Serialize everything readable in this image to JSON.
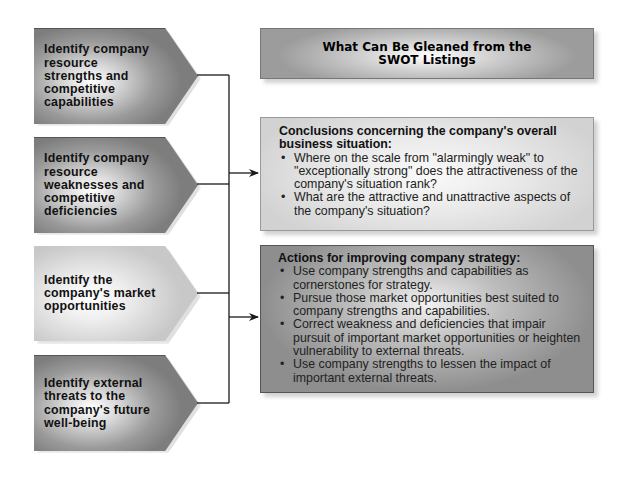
{
  "left_boxes": [
    {
      "id": "strengths",
      "text": "Identify company resource strengths and competitive capabilities",
      "shade": "dark"
    },
    {
      "id": "weaknesses",
      "text": "Identify company resource weaknesses and competitive deficiencies",
      "shade": "dark"
    },
    {
      "id": "opportunities",
      "text": "Identify the company's market opportunities",
      "shade": "light"
    },
    {
      "id": "threats",
      "text": "Identify external threats to the company's future well-being",
      "shade": "dark"
    }
  ],
  "title_box": {
    "text": "What Can Be Gleaned from the SWOT Listings"
  },
  "conclusions": {
    "heading": "Conclusions concerning the company's overall business situation:",
    "bullets": [
      "Where on the scale from \"alarmingly weak\" to \"exceptionally strong\" does the attractiveness of the company's situation rank?",
      "What are the attractive and unattractive aspects of the company's situation?"
    ]
  },
  "actions": {
    "heading": "Actions for improving company strategy:",
    "bullets": [
      "Use company strengths and capabilities as cornerstones for strategy.",
      "Pursue those market opportunities best suited to company strengths and capabilities.",
      "Correct weakness and deficiencies that impair pursuit of important market opportunities or heighten vulnerability to external threats.",
      "Use company strengths to lessen the impact of important external threats."
    ]
  },
  "colors": {
    "line": "#1a1a1a",
    "dark_box": "#7d7d7d",
    "light_box": "#d4d4d4"
  }
}
